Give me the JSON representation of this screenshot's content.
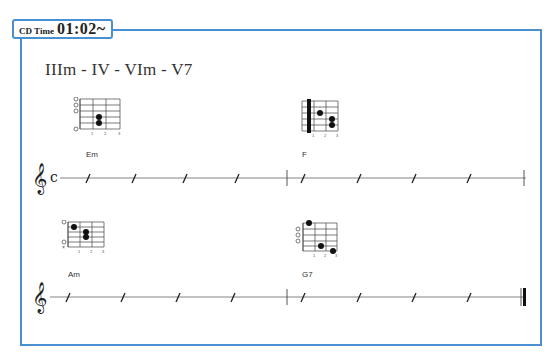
{
  "header": {
    "cd_label": "CD Time",
    "cd_time": "01:02~"
  },
  "progression": "IIIm - IV - VIm - V7",
  "colors": {
    "frame": "#4a90d0",
    "ink": "#333333"
  },
  "rows": [
    {
      "time_signature": "C",
      "chords": [
        {
          "name": "Em",
          "open_strings": [
            "1",
            "2",
            "3",
            "6"
          ],
          "dots": [
            {
              "string": 4,
              "fret": 2
            },
            {
              "string": 5,
              "fret": 2
            }
          ],
          "fret_numbers": [
            "1",
            "2",
            "3"
          ]
        },
        {
          "name": "F",
          "barre": 1,
          "dots": [
            {
              "string": 3,
              "fret": 2
            },
            {
              "string": 4,
              "fret": 3
            },
            {
              "string": 5,
              "fret": 3
            }
          ],
          "fret_numbers": [
            "1",
            "2",
            "3"
          ]
        }
      ],
      "ending": "single-barline"
    },
    {
      "time_signature": "",
      "chords": [
        {
          "name": "Am",
          "open_strings": [
            "1",
            "5"
          ],
          "muted_strings": [
            "6"
          ],
          "dots": [
            {
              "string": 2,
              "fret": 1
            },
            {
              "string": 3,
              "fret": 2
            },
            {
              "string": 4,
              "fret": 2
            }
          ],
          "fret_numbers": [
            "1",
            "2",
            "3"
          ]
        },
        {
          "name": "G7",
          "open_strings": [
            "2",
            "3",
            "4"
          ],
          "dots": [
            {
              "string": 1,
              "fret": 1
            },
            {
              "string": 5,
              "fret": 2
            },
            {
              "string": 6,
              "fret": 3
            }
          ],
          "fret_numbers": [
            "1",
            "2",
            "3"
          ]
        }
      ],
      "ending": "final-barline"
    }
  ]
}
